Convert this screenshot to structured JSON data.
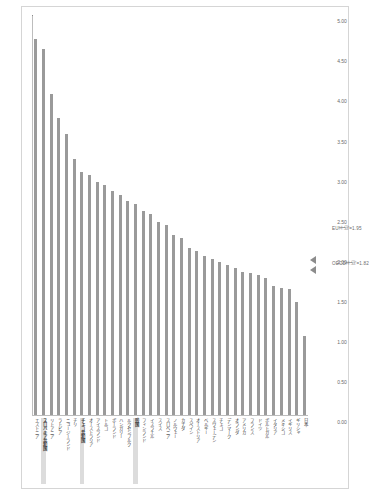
{
  "figure": {
    "title": "【図1】2000～2017年 国別成長率（GDP、OECD比較）"
  },
  "chart_data": {
    "type": "bar",
    "title": "【図1】2000～2017年 国別成長率（GDP、OECD比較）",
    "xlabel": "",
    "ylabel": "",
    "orientation": "vertical",
    "ylim": [
      0.0,
      5.0
    ],
    "ytick_step": 0.5,
    "grid": true,
    "legend": null,
    "bar_color": "#9a9a9a",
    "yticks": [
      "0.00",
      "0.50",
      "1.00",
      "1.50",
      "2.00",
      "2.50",
      "3.00",
      "3.50",
      "4.00",
      "4.50",
      "5.00"
    ],
    "categories": [
      "エストニア",
      "スロバキア共和国",
      "リトアニア",
      "ラトビア",
      "ニュージーランド",
      "チリ",
      "チェコ共和国",
      "オーストラリア",
      "アイスランド",
      "トルコ",
      "ポーランド",
      "ハンガリー",
      "ルクセンブルク",
      "韓国",
      "フィンランド",
      "イスラエル",
      "スイス",
      "スロベニア",
      "ノルウェー",
      "カナダ",
      "スペイン",
      "オーストリア",
      "ベルギー",
      "スウェーデン",
      "チェコ",
      "デンマーク",
      "オランダ",
      "アメリカ",
      "フランス",
      "ドイツ",
      "ポルトガル",
      "イタリア",
      "メキシコ",
      "イギリス",
      "ギリシャ",
      "日本"
    ],
    "values": [
      4.7,
      4.58,
      4.02,
      3.72,
      3.52,
      3.2,
      3.04,
      3.0,
      2.92,
      2.88,
      2.8,
      2.76,
      2.68,
      2.64,
      2.56,
      2.52,
      2.42,
      2.38,
      2.26,
      2.22,
      2.1,
      2.06,
      2.0,
      1.96,
      1.92,
      1.88,
      1.84,
      1.8,
      1.78,
      1.76,
      1.72,
      1.62,
      1.6,
      1.58,
      1.42,
      1.0
    ],
    "highlighted_categories": [
      "スロバキア共和国",
      "チェコ共和国",
      "韓国"
    ],
    "reference_lines": [
      {
        "label": "EU平均=1.95",
        "value": 1.95
      },
      {
        "label": "OECD平均=1.82",
        "value": 1.82
      }
    ]
  }
}
